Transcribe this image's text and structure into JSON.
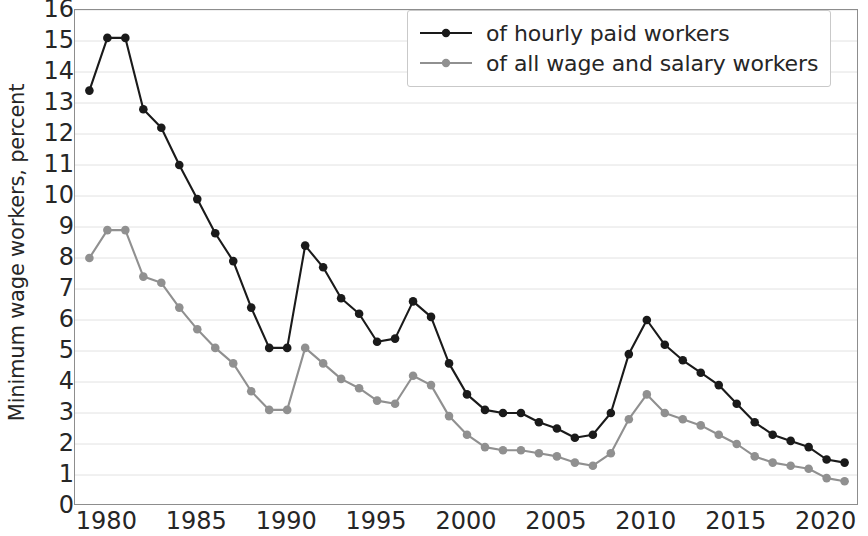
{
  "chart_data": {
    "type": "line",
    "title": "",
    "subtitle": "",
    "xlabel": "",
    "ylabel": "Minimum wage workers, percent",
    "xlim": [
      1978.2,
      2021.8
    ],
    "ylim": [
      0,
      16
    ],
    "xticks": [
      1980,
      1985,
      1990,
      1995,
      2000,
      2005,
      2010,
      2015,
      2020
    ],
    "yticks": [
      0,
      1,
      2,
      3,
      4,
      5,
      6,
      7,
      8,
      9,
      10,
      11,
      12,
      13,
      14,
      15,
      16
    ],
    "grid": true,
    "grid_axis": "y",
    "legend_position": "top-right",
    "x": [
      1979,
      1980,
      1981,
      1982,
      1983,
      1984,
      1985,
      1986,
      1987,
      1988,
      1989,
      1990,
      1991,
      1992,
      1993,
      1994,
      1995,
      1996,
      1997,
      1998,
      1999,
      2000,
      2001,
      2002,
      2003,
      2004,
      2005,
      2006,
      2007,
      2008,
      2009,
      2010,
      2011,
      2012,
      2013,
      2014,
      2015,
      2016,
      2017,
      2018,
      2019,
      2020,
      2021
    ],
    "series": [
      {
        "name": "of hourly paid workers",
        "color": "#1a1a1a",
        "marker": "circle",
        "values": [
          13.4,
          15.1,
          15.1,
          12.8,
          12.2,
          11.0,
          9.9,
          8.8,
          7.9,
          6.4,
          5.1,
          5.1,
          8.4,
          7.7,
          6.7,
          6.2,
          5.3,
          5.4,
          6.6,
          6.1,
          4.6,
          3.6,
          3.1,
          3.0,
          3.0,
          2.7,
          2.5,
          2.2,
          2.3,
          3.0,
          4.9,
          6.0,
          5.2,
          4.7,
          4.3,
          3.9,
          3.3,
          2.7,
          2.3,
          2.1,
          1.9,
          1.5,
          1.4
        ]
      },
      {
        "name": "of all wage and salary workers",
        "color": "#909090",
        "marker": "circle",
        "values": [
          8.0,
          8.9,
          8.9,
          7.4,
          7.2,
          6.4,
          5.7,
          5.1,
          4.6,
          3.7,
          3.1,
          3.1,
          5.1,
          4.6,
          4.1,
          3.8,
          3.4,
          3.3,
          4.2,
          3.9,
          2.9,
          2.3,
          1.9,
          1.8,
          1.8,
          1.7,
          1.6,
          1.4,
          1.3,
          1.7,
          2.8,
          3.6,
          3.0,
          2.8,
          2.6,
          2.3,
          2.0,
          1.6,
          1.4,
          1.3,
          1.2,
          0.9,
          0.8
        ]
      }
    ]
  },
  "legend": {
    "items": [
      {
        "label": "of hourly paid workers"
      },
      {
        "label": "of all wage and salary workers"
      }
    ]
  },
  "axes": {
    "y_title": "Minimum wage workers, percent"
  }
}
